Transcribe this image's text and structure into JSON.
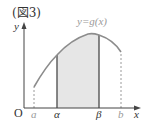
{
  "figure": {
    "title": "(図3)",
    "function_label": "y=g(x)",
    "axes": {
      "x_label": "x",
      "y_label": "y",
      "origin_label": "O"
    },
    "x_marks": [
      {
        "label": "a",
        "role": "domain-start",
        "style": "gray"
      },
      {
        "label": "α",
        "role": "integration-lower",
        "style": "dark"
      },
      {
        "label": "β",
        "role": "integration-upper",
        "style": "dark"
      },
      {
        "label": "b",
        "role": "domain-end",
        "style": "gray"
      }
    ],
    "shaded_region": {
      "from": "α",
      "to": "β",
      "fill": "#e6e6e6"
    },
    "colors": {
      "curve": "#8c8c8c",
      "axis": "#444444",
      "bound_line": "#555555",
      "dashed": "#9a9a9a",
      "shade": "#e6e6e6"
    }
  }
}
